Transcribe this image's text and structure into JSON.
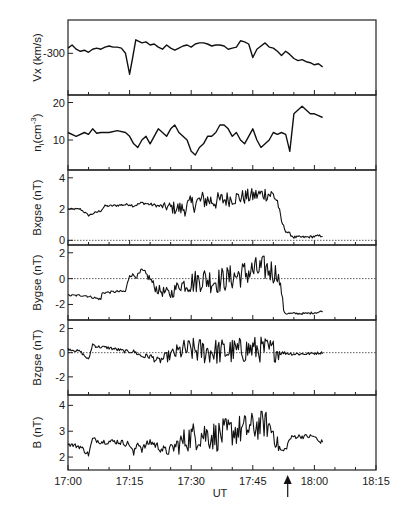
{
  "chart_data": {
    "type": "line",
    "layout": "stacked-panels",
    "xlabel": "UT",
    "x_ticks": [
      "17:00",
      "17:15",
      "17:30",
      "17:45",
      "18:00",
      "18:15"
    ],
    "x_range_minutes": [
      0,
      75
    ],
    "x_tick_minor_step_minutes": 5,
    "annotation": {
      "type": "arrow",
      "at_minute": 53.5,
      "direction": "up",
      "description": "upward arrow under time axis marking event time"
    },
    "panels": [
      {
        "id": "vx",
        "ylabel": "Vx (km/s)",
        "ylim": [
          -340,
          -268
        ],
        "y_ticks": [
          {
            "value": -300,
            "label": "-300"
          }
        ],
        "zero_line": false,
        "series": {
          "t": [
            0,
            1,
            2,
            3,
            4,
            5,
            6,
            7,
            8,
            9,
            10,
            11,
            12,
            13,
            14,
            15,
            15.7,
            16.5,
            17,
            18,
            19,
            20,
            21,
            22,
            23,
            24,
            25,
            26,
            27,
            28,
            29,
            30,
            31,
            32,
            33,
            34,
            35,
            36,
            37,
            38,
            39,
            40,
            41,
            42,
            43,
            44,
            45,
            46,
            47,
            48,
            49,
            50,
            51,
            52,
            53,
            54,
            55,
            56,
            57,
            58,
            59,
            60,
            61,
            62
          ],
          "v": [
            -295,
            -292,
            -296,
            -298,
            -297,
            -299,
            -296,
            -295,
            -296,
            -294,
            -293,
            -294,
            -294,
            -295,
            -300,
            -320,
            -305,
            -287,
            -288,
            -290,
            -289,
            -292,
            -291,
            -294,
            -296,
            -292,
            -295,
            -297,
            -295,
            -293,
            -292,
            -294,
            -291,
            -290,
            -290,
            -291,
            -293,
            -292,
            -292,
            -293,
            -296,
            -295,
            -294,
            -288,
            -289,
            -291,
            -304,
            -296,
            -293,
            -290,
            -294,
            -295,
            -298,
            -302,
            -298,
            -301,
            -305,
            -307,
            -306,
            -308,
            -309,
            -311,
            -310,
            -313
          ]
        }
      },
      {
        "id": "ni",
        "ylabel": "n_i(cm^-3)",
        "ylabel_main": "n",
        "ylabel_sub": "i",
        "ylabel_unit": "(cm",
        "ylabel_sup": "-3",
        "ylabel_close": ")",
        "ylim": [
          2,
          22
        ],
        "y_ticks": [
          {
            "value": 10,
            "label": "10"
          },
          {
            "value": 20,
            "label": "20"
          }
        ],
        "zero_line": false,
        "series": {
          "t": [
            0,
            2,
            4,
            5,
            6,
            7,
            8,
            10,
            12,
            14,
            15,
            16,
            17,
            18,
            19,
            20,
            21,
            22,
            23,
            24,
            25,
            26,
            27,
            28,
            29,
            30,
            31,
            32,
            33,
            34,
            35,
            36,
            37,
            38,
            39,
            40,
            41,
            42,
            43,
            44,
            45,
            46,
            47,
            48,
            49,
            50,
            51,
            52,
            53,
            54,
            55,
            56,
            57,
            58,
            59,
            60,
            61,
            62
          ],
          "v": [
            12,
            11,
            12,
            11.5,
            13,
            11.8,
            12,
            12,
            12.5,
            12,
            11,
            9,
            8,
            10,
            11,
            9,
            11,
            13,
            12,
            11,
            13,
            14,
            12,
            11,
            10,
            7,
            6,
            8,
            9,
            11,
            11,
            12,
            14,
            14,
            13,
            11,
            12,
            10,
            9,
            11,
            13,
            10,
            8,
            9,
            10,
            12,
            11.5,
            12,
            11.5,
            7,
            17,
            18,
            19,
            18,
            17,
            17,
            16.5,
            16
          ]
        }
      },
      {
        "id": "bx",
        "ylabel": "Bxgse (nT)",
        "ylim": [
          -0.3,
          4.5
        ],
        "y_ticks": [
          {
            "value": 0,
            "label": "0"
          },
          {
            "value": 2,
            "label": "2"
          },
          {
            "value": 4,
            "label": "4"
          }
        ],
        "zero_line": true,
        "noise_profile": "quiet 0-22 min (~2.0-2.3), turbulent 22-51 min rising to ~3.5, drop to ~0.2 at 52-62 min",
        "anchors_t": [
          0,
          3,
          4,
          5,
          8,
          9,
          10,
          15,
          16,
          18,
          20,
          22,
          25,
          28,
          30,
          33,
          36,
          40,
          44,
          48,
          50,
          51,
          52,
          53,
          55,
          58,
          62
        ],
        "anchors_v": [
          2.0,
          2.0,
          1.8,
          1.6,
          1.9,
          2.2,
          2.2,
          2.3,
          2.2,
          2.4,
          2.3,
          2.2,
          2.1,
          2.0,
          2.3,
          2.6,
          2.5,
          2.7,
          2.8,
          3.0,
          2.9,
          2.5,
          1.2,
          0.6,
          0.2,
          0.2,
          0.3
        ],
        "noise_t": [
          0,
          22,
          25,
          30,
          35,
          40,
          45,
          50,
          51,
          52,
          62
        ],
        "noise_a": [
          0.05,
          0.1,
          0.4,
          0.6,
          0.6,
          0.5,
          0.5,
          0.5,
          0.3,
          0.1,
          0.08
        ]
      },
      {
        "id": "by",
        "ylabel": "Bygse (nT)",
        "ylim": [
          -3.2,
          2.6
        ],
        "y_ticks": [
          {
            "value": -2,
            "label": "-2"
          },
          {
            "value": 0,
            "label": "0"
          },
          {
            "value": 2,
            "label": "2"
          }
        ],
        "zero_line": true,
        "anchors_t": [
          0,
          4,
          8,
          8.3,
          12,
          14,
          15,
          17,
          18,
          20,
          21,
          22,
          25,
          27,
          30,
          33,
          36,
          40,
          44,
          48,
          51,
          52,
          52.5,
          53,
          55,
          58,
          61,
          62
        ],
        "anchors_v": [
          -1.3,
          -1.3,
          -1.6,
          -1.1,
          -1.0,
          -1.0,
          0.3,
          0.2,
          0.6,
          0.0,
          -0.6,
          -0.9,
          -1.2,
          -0.5,
          -0.3,
          0.0,
          -0.2,
          0.1,
          0.5,
          0.8,
          0.4,
          -1.0,
          -2.4,
          -2.7,
          -2.7,
          -2.7,
          -2.6,
          -2.5
        ],
        "noise_t": [
          0,
          14,
          18,
          22,
          27,
          30,
          35,
          40,
          45,
          50,
          52,
          53,
          62
        ],
        "noise_a": [
          0.08,
          0.1,
          0.25,
          0.4,
          0.5,
          0.9,
          1.0,
          1.0,
          1.1,
          1.0,
          0.3,
          0.08,
          0.08
        ]
      },
      {
        "id": "bz",
        "ylabel": "Bzgse (nT)",
        "ylim": [
          -3.5,
          2.7
        ],
        "y_ticks": [
          {
            "value": -2,
            "label": "-2"
          },
          {
            "value": 0,
            "label": "0"
          },
          {
            "value": 2,
            "label": "2"
          }
        ],
        "zero_line": true,
        "anchors_t": [
          0,
          3,
          5,
          6,
          7,
          10,
          14,
          16,
          18,
          20,
          22,
          25,
          28,
          30,
          35,
          40,
          45,
          50,
          52,
          55,
          58,
          62
        ],
        "anchors_v": [
          0.3,
          0.1,
          -0.6,
          0.7,
          0.5,
          0.4,
          0.1,
          0.1,
          -0.3,
          -0.3,
          -0.7,
          -0.2,
          0.2,
          0.2,
          0.1,
          0.1,
          0.3,
          0.2,
          0.0,
          -0.1,
          -0.1,
          0.0
        ],
        "noise_t": [
          0,
          15,
          18,
          22,
          25,
          28,
          32,
          40,
          48,
          51,
          52,
          62
        ],
        "noise_a": [
          0.1,
          0.15,
          0.2,
          0.3,
          0.5,
          0.9,
          1.1,
          1.1,
          1.1,
          0.9,
          0.15,
          0.1
        ]
      },
      {
        "id": "b",
        "ylabel": "B (nT)",
        "ylim": [
          1.5,
          4.4
        ],
        "y_ticks": [
          {
            "value": 2,
            "label": "2"
          },
          {
            "value": 3,
            "label": "3"
          },
          {
            "value": 4,
            "label": "4"
          }
        ],
        "zero_line": false,
        "anchors_t": [
          0,
          3,
          5,
          6,
          8,
          12,
          15,
          16,
          17,
          18,
          20,
          22,
          24,
          26,
          28,
          30,
          33,
          36,
          40,
          44,
          48,
          50,
          51,
          52,
          53,
          54,
          55,
          58,
          60,
          61,
          62
        ],
        "anchors_v": [
          2.5,
          2.4,
          2.1,
          2.7,
          2.6,
          2.6,
          2.5,
          2.1,
          2.6,
          2.3,
          2.6,
          2.4,
          2.2,
          2.4,
          2.6,
          2.8,
          2.9,
          2.8,
          3.0,
          3.1,
          3.3,
          3.0,
          2.5,
          2.2,
          2.3,
          2.7,
          2.8,
          2.8,
          2.8,
          2.6,
          2.6
        ],
        "noise_t": [
          0,
          15,
          20,
          25,
          28,
          32,
          38,
          45,
          50,
          51,
          53,
          62
        ],
        "noise_a": [
          0.08,
          0.12,
          0.15,
          0.2,
          0.5,
          0.6,
          0.6,
          0.6,
          0.5,
          0.3,
          0.1,
          0.08
        ]
      }
    ]
  },
  "figure": {
    "plot_left": 68,
    "plot_right": 376,
    "plot_top": 20,
    "panel_height": 75,
    "line_color": "#111111",
    "axis_color": "#222222",
    "dotted_color": "#333333"
  }
}
